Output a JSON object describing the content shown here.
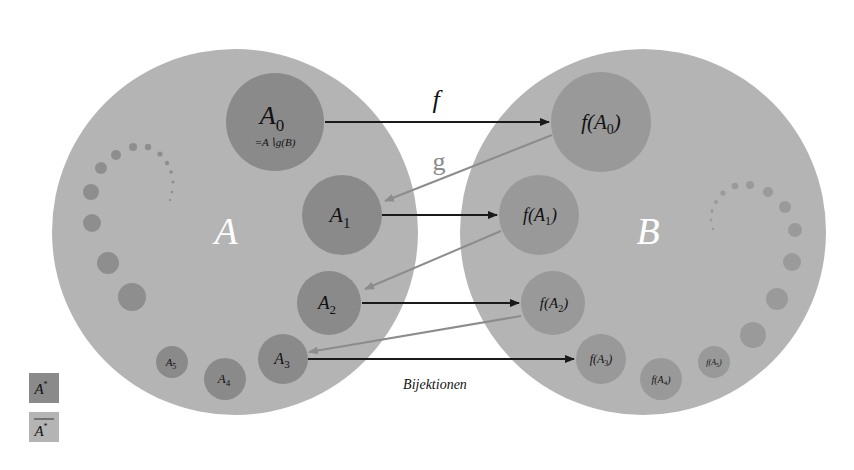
{
  "colors": {
    "background": "#ffffff",
    "set_fill": "#b4b4b4",
    "subset_fill": "#8a8a8a",
    "image_fill": "#999999",
    "f_arrow": "#1a1a1a",
    "g_arrow": "#8c8c8c",
    "set_label": "#ffffff"
  },
  "sets": {
    "A": {
      "label": "A"
    },
    "B": {
      "label": "B"
    }
  },
  "left_subsets": {
    "A0": {
      "main": "A",
      "sub": "0",
      "note": "=A∖g(B)"
    },
    "A1": {
      "main": "A",
      "sub": "1"
    },
    "A2": {
      "main": "A",
      "sub": "2"
    },
    "A3": {
      "main": "A",
      "sub": "3"
    },
    "A4": {
      "main": "A",
      "sub": "4"
    },
    "A5": {
      "main": "A",
      "sub": "5"
    }
  },
  "right_subsets": {
    "fA0": {
      "pre": "f(A",
      "sub": "0",
      "post": ")"
    },
    "fA1": {
      "pre": "f(A",
      "sub": "1",
      "post": ")"
    },
    "fA2": {
      "pre": "f(A",
      "sub": "2",
      "post": ")"
    },
    "fA3": {
      "pre": "f(A",
      "sub": "3",
      "post": ")"
    },
    "fA4": {
      "pre": "f(A",
      "sub": "4",
      "post": ")"
    },
    "fA5": {
      "pre": "f(A",
      "sub": "5",
      "post": ")"
    }
  },
  "arrows": {
    "f_label": "f",
    "g_label": "g",
    "caption": "Bijektionen"
  },
  "legend": {
    "items": [
      {
        "label": "A",
        "sup": "*",
        "overline": false
      },
      {
        "label": "A",
        "sup": "*",
        "overline": true
      }
    ]
  }
}
